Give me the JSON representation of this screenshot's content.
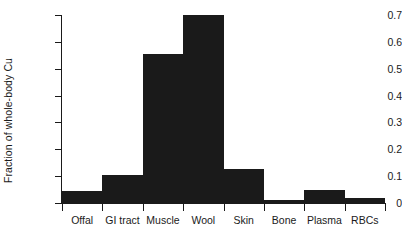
{
  "chart_data": {
    "type": "bar",
    "title": "",
    "subtitle": "",
    "xlabel": "",
    "ylabel": "Fraction of whole-body Cu",
    "categories": [
      "Offal",
      "GI tract",
      "Muscle",
      "Wool",
      "Skin",
      "Bone",
      "Plasma",
      "RBCs"
    ],
    "values": [
      0.045,
      0.105,
      0.555,
      0.7,
      0.125,
      0.012,
      0.048,
      0.018
    ],
    "series": [
      {
        "name": "Fraction of whole-body Cu",
        "values": [
          0.045,
          0.105,
          0.555,
          0.7,
          0.125,
          0.012,
          0.048,
          0.018
        ]
      }
    ],
    "ylim": [
      0,
      0.7
    ],
    "xlim": [
      0,
      8
    ],
    "ytick_labels": [
      "0",
      "0.1",
      "0.2",
      "0.3",
      "0.4",
      "0.5",
      "0.6",
      "0.7"
    ],
    "ytick_values": [
      0,
      0.1,
      0.2,
      0.3,
      0.4,
      0.5,
      0.6,
      0.7
    ],
    "grid": false,
    "legend": false,
    "legend_position": "none",
    "bar_color": "#1a1a1a",
    "axis_color": "#1a1a1a",
    "background_color": "#ffffff",
    "bar_style": "adjacent-no-gap"
  }
}
